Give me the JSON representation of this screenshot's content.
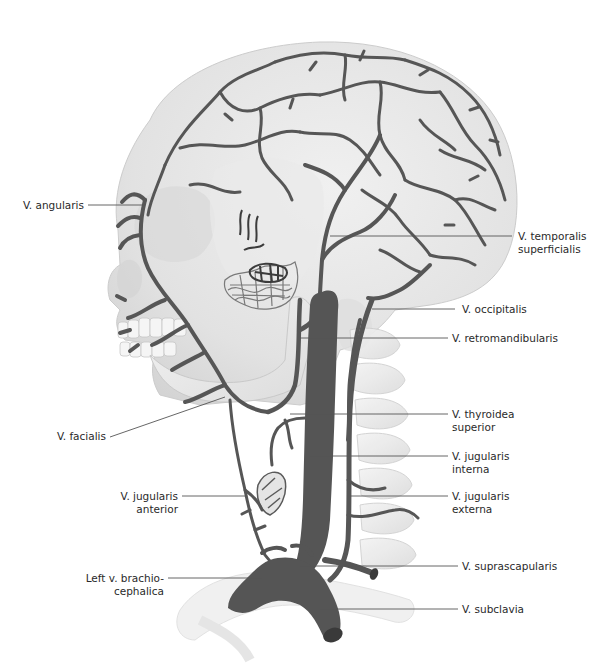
{
  "figure": {
    "colors": {
      "vein": "#565656",
      "vein_dark": "#3c3c3c",
      "skull": "#e6e6e6",
      "skull_shadow": "#cfcfcf",
      "leader_line": "#555555",
      "label_text": "#2a2a2a",
      "background": "#ffffff"
    }
  },
  "labels": {
    "left": [
      {
        "id": "angularis",
        "lines": [
          "V. angularis"
        ]
      },
      {
        "id": "facialis",
        "lines": [
          "V. facialis"
        ]
      },
      {
        "id": "jugularis_anterior",
        "lines": [
          "V. jugularis",
          "anterior"
        ]
      },
      {
        "id": "brachiocephalica",
        "lines": [
          "Left v. brachio-",
          "cephalica"
        ]
      }
    ],
    "right": [
      {
        "id": "temporalis_superficialis",
        "lines": [
          "V. temporalis",
          "superficialis"
        ]
      },
      {
        "id": "occipitalis",
        "lines": [
          "V. occipitalis"
        ]
      },
      {
        "id": "retromandibularis",
        "lines": [
          "V. retromandibularis"
        ]
      },
      {
        "id": "thyroidea_superior",
        "lines": [
          "V. thyroidea",
          "superior"
        ]
      },
      {
        "id": "jugularis_interna",
        "lines": [
          "V. jugularis",
          "interna"
        ]
      },
      {
        "id": "jugularis_externa",
        "lines": [
          "V. jugularis",
          "externa"
        ]
      },
      {
        "id": "suprascapularis",
        "lines": [
          "V. suprascapularis"
        ]
      },
      {
        "id": "subclavia",
        "lines": [
          "V. subclavia"
        ]
      }
    ]
  }
}
